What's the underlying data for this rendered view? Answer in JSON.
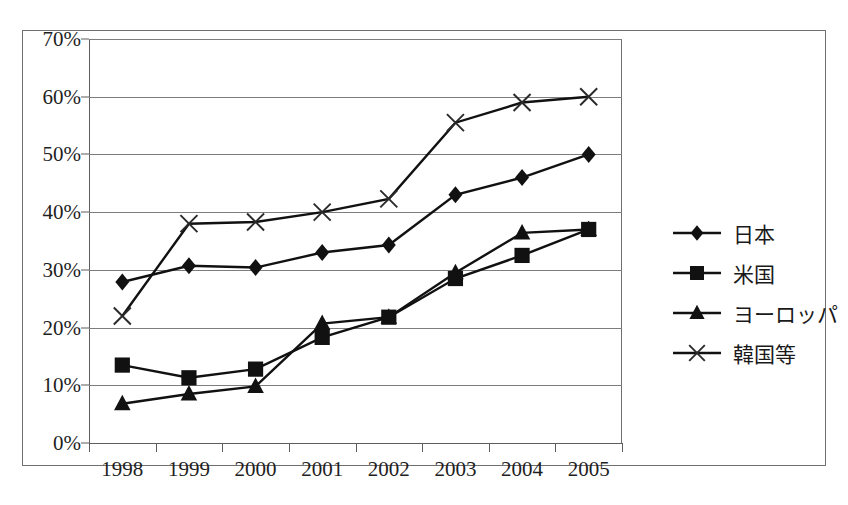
{
  "chart_data": {
    "type": "line",
    "title": "",
    "xlabel": "",
    "ylabel": "",
    "categories": [
      "1998",
      "1999",
      "2000",
      "2001",
      "2002",
      "2003",
      "2004",
      "2005"
    ],
    "ylim": [
      0,
      70
    ],
    "ytick_values": [
      0,
      10,
      20,
      30,
      40,
      50,
      60,
      70
    ],
    "ytick_labels": [
      "0%",
      "10%",
      "20%",
      "30%",
      "40%",
      "50%",
      "60%",
      "70%"
    ],
    "grid": "horizontal",
    "legend_position": "right",
    "series": [
      {
        "name": "日本",
        "marker": "diamond",
        "values": [
          27.9,
          30.7,
          30.4,
          33.0,
          34.3,
          43.0,
          46.0,
          50.0
        ]
      },
      {
        "name": "米国",
        "marker": "square",
        "values": [
          13.5,
          11.3,
          12.8,
          18.3,
          21.8,
          28.5,
          32.5,
          37.0
        ]
      },
      {
        "name": "ヨーロッパ",
        "marker": "triangle",
        "values": [
          6.8,
          8.5,
          9.8,
          20.7,
          21.8,
          29.5,
          36.4,
          37.0
        ]
      },
      {
        "name": "韓国等",
        "marker": "x",
        "values": [
          22.0,
          38.0,
          38.3,
          40.0,
          42.3,
          55.5,
          59.0,
          60.0
        ]
      }
    ]
  }
}
